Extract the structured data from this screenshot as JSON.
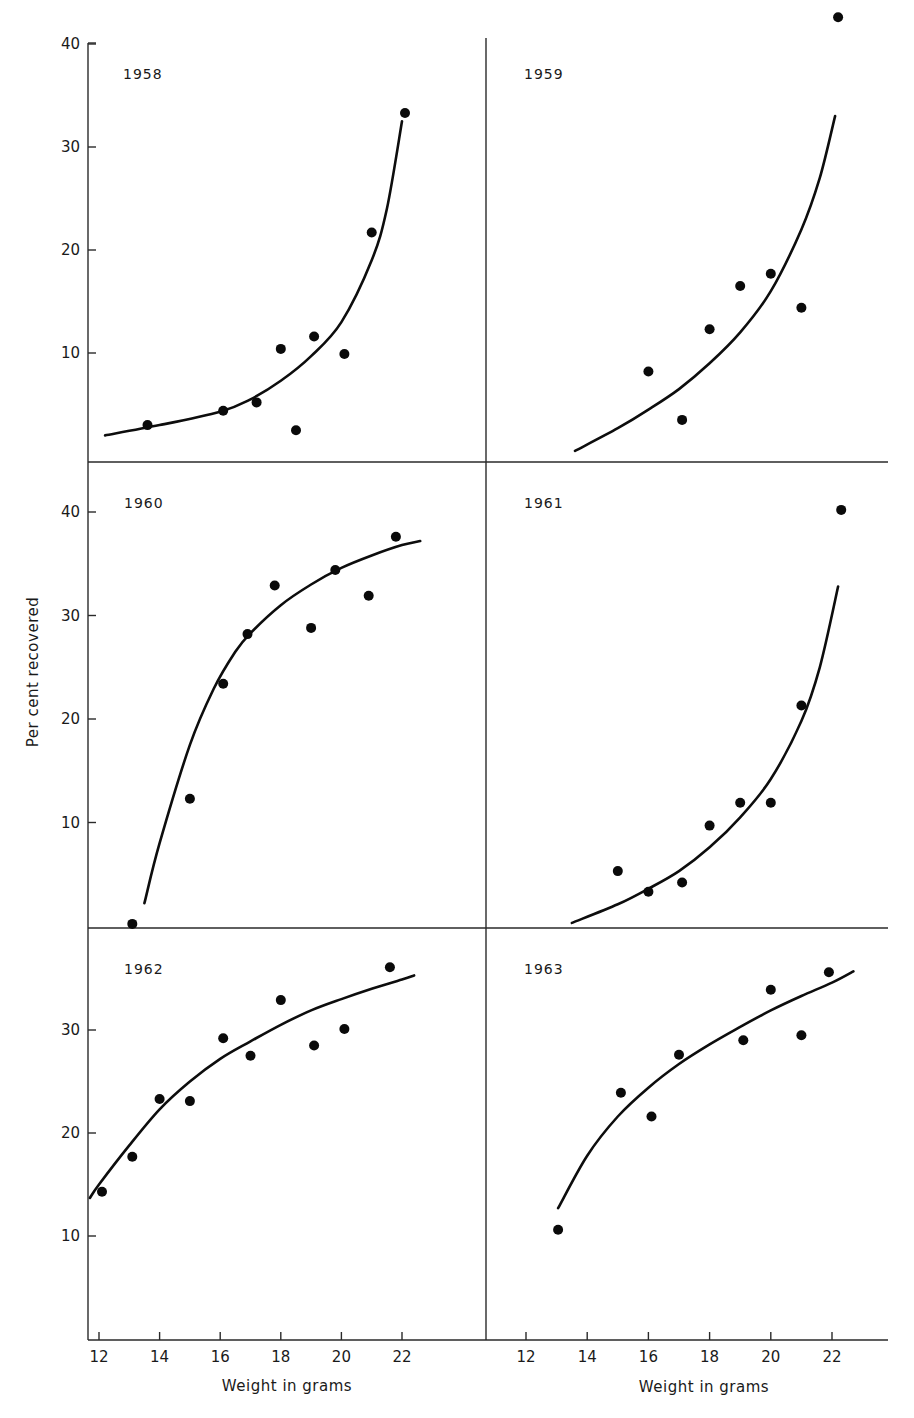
{
  "figure": {
    "ylabel": "Per cent recovered",
    "xlabel": "Weight in grams"
  },
  "chart_data": [
    {
      "type": "scatter",
      "title": "1958",
      "xlabel": "",
      "ylabel": "Per cent recovered",
      "x_ticks": [
        12,
        14,
        16,
        18,
        20,
        22
      ],
      "y_ticks": [
        10,
        20,
        30,
        40
      ],
      "ylim": [
        0,
        40
      ],
      "grid": false,
      "points": {
        "x": [
          13.6,
          16.1,
          17.2,
          18.0,
          18.5,
          19.1,
          20.1,
          21.0,
          22.1
        ],
        "y": [
          3.0,
          4.4,
          5.2,
          10.4,
          2.5,
          11.6,
          9.9,
          21.7,
          33.3
        ]
      },
      "fitted_curve": {
        "x": [
          12.2,
          14,
          16,
          17,
          18,
          19,
          20,
          21,
          21.5,
          22.0
        ],
        "y": [
          2.0,
          3.0,
          4.3,
          5.5,
          7.3,
          9.7,
          13.0,
          19.0,
          24.0,
          32.5
        ]
      }
    },
    {
      "type": "scatter",
      "title": "1959",
      "xlabel": "",
      "ylabel": "",
      "x_ticks": [
        12,
        14,
        16,
        18,
        20,
        22
      ],
      "y_ticks": [
        10,
        20,
        30,
        40
      ],
      "ylim": [
        0,
        40
      ],
      "grid": false,
      "points": {
        "x": [
          16.0,
          17.1,
          18.0,
          19.0,
          20.0,
          21.0,
          22.2
        ],
        "y": [
          8.2,
          3.5,
          12.3,
          16.5,
          17.7,
          14.4,
          42.6
        ]
      },
      "fitted_curve": {
        "x": [
          13.6,
          15,
          16,
          17,
          18,
          19,
          20,
          21,
          21.6,
          22.1
        ],
        "y": [
          0.5,
          2.7,
          4.5,
          6.5,
          9.0,
          12.0,
          16.0,
          22.0,
          27.0,
          33.0
        ]
      }
    },
    {
      "type": "scatter",
      "title": "1960",
      "xlabel": "",
      "ylabel": "Per cent recovered",
      "x_ticks": [
        12,
        14,
        16,
        18,
        20,
        22
      ],
      "y_ticks": [
        10,
        20,
        30,
        40
      ],
      "ylim": [
        0,
        40
      ],
      "grid": false,
      "points": {
        "x": [
          13.1,
          15.0,
          16.1,
          16.9,
          17.8,
          19.0,
          19.8,
          20.9,
          21.8
        ],
        "y": [
          0.2,
          12.3,
          23.4,
          28.2,
          32.9,
          28.8,
          34.4,
          31.9,
          37.6
        ]
      },
      "fitted_curve": {
        "x": [
          13.5,
          14,
          15,
          15.8,
          16.5,
          17,
          18,
          19,
          20,
          21,
          22,
          22.6
        ],
        "y": [
          2.2,
          8.0,
          17.5,
          23.0,
          26.5,
          28.3,
          31.0,
          33.0,
          34.6,
          35.8,
          36.8,
          37.2
        ]
      }
    },
    {
      "type": "scatter",
      "title": "1961",
      "xlabel": "",
      "ylabel": "",
      "x_ticks": [
        12,
        14,
        16,
        18,
        20,
        22
      ],
      "y_ticks": [
        10,
        20,
        30,
        40
      ],
      "ylim": [
        0,
        40
      ],
      "grid": false,
      "points": {
        "x": [
          15.0,
          16.0,
          17.1,
          18.0,
          19.0,
          20.0,
          21.0,
          22.3
        ],
        "y": [
          5.3,
          3.3,
          4.2,
          9.7,
          11.9,
          11.9,
          21.3,
          40.2
        ]
      },
      "fitted_curve": {
        "x": [
          13.5,
          15,
          16,
          17,
          18,
          19,
          20,
          21,
          21.6,
          22.2
        ],
        "y": [
          0.3,
          2.1,
          3.6,
          5.3,
          7.6,
          10.5,
          14.2,
          19.8,
          25.0,
          32.8
        ]
      }
    },
    {
      "type": "scatter",
      "title": "1962",
      "xlabel": "Weight in grams",
      "ylabel": "Per cent recovered",
      "x_ticks": [
        12,
        14,
        16,
        18,
        20,
        22
      ],
      "y_ticks": [
        10,
        20,
        30
      ],
      "ylim": [
        0,
        40
      ],
      "grid": false,
      "points": {
        "x": [
          12.1,
          13.1,
          14.0,
          15.0,
          16.1,
          17.0,
          18.0,
          19.1,
          20.1,
          21.6
        ],
        "y": [
          14.3,
          17.7,
          23.3,
          23.1,
          29.2,
          27.5,
          32.9,
          28.5,
          30.1,
          36.1
        ]
      },
      "fitted_curve": {
        "x": [
          11.7,
          12,
          13,
          14,
          15,
          16,
          17,
          18,
          19,
          20,
          21,
          22,
          22.4
        ],
        "y": [
          13.7,
          15.0,
          18.8,
          22.3,
          25.0,
          27.2,
          28.9,
          30.5,
          31.9,
          33.0,
          34.0,
          34.9,
          35.3
        ]
      }
    },
    {
      "type": "scatter",
      "title": "1963",
      "xlabel": "Weight in grams",
      "ylabel": "",
      "x_ticks": [
        12,
        14,
        16,
        18,
        20,
        22
      ],
      "y_ticks": [
        10,
        20,
        30
      ],
      "ylim": [
        0,
        40
      ],
      "grid": false,
      "points": {
        "x": [
          13.05,
          15.1,
          16.1,
          17.0,
          19.1,
          20.0,
          21.0,
          21.9
        ],
        "y": [
          10.6,
          23.9,
          21.6,
          27.6,
          29.0,
          33.9,
          29.5,
          35.6
        ]
      },
      "fitted_curve": {
        "x": [
          13.05,
          14,
          15,
          16,
          17,
          18,
          19,
          20,
          21,
          22,
          22.7
        ],
        "y": [
          12.7,
          17.8,
          21.6,
          24.4,
          26.7,
          28.6,
          30.3,
          31.9,
          33.3,
          34.6,
          35.7
        ]
      }
    }
  ],
  "colors": {
    "ink": "#0d0d0d",
    "axis": "#2a2a2a",
    "background": "#ffffff"
  }
}
